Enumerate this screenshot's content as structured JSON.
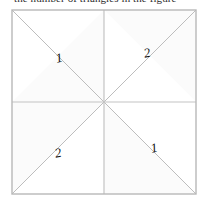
{
  "caption": {
    "text": "the number of triangles in the figure"
  },
  "figure": {
    "name": "square-divided-into-eight-triangles",
    "square": {
      "x": 12,
      "y": 10,
      "size": 184
    },
    "colors": {
      "outline": "#b8b8b8",
      "inner_line": "#c0c0c0",
      "diagonal": "#bdbdbd",
      "fill_light": "#ffffff",
      "fill_shade": "#fafafa",
      "label": "#111111"
    },
    "labels": [
      {
        "id": "label-top-left",
        "text": "1",
        "x": 60,
        "y": 62,
        "rotate": -12
      },
      {
        "id": "label-top-right",
        "text": "2",
        "x": 148,
        "y": 57,
        "rotate": -12
      },
      {
        "id": "label-bottom-left",
        "text": "2",
        "x": 59,
        "y": 157,
        "rotate": -12
      },
      {
        "id": "label-bottom-right",
        "text": "1",
        "x": 155,
        "y": 152,
        "rotate": -12
      }
    ],
    "quadrants": [
      {
        "name": "top-left",
        "diagonal": "main",
        "label": "1"
      },
      {
        "name": "top-right",
        "diagonal": "anti",
        "label": "2"
      },
      {
        "name": "bottom-left",
        "diagonal": "anti",
        "label": "2"
      },
      {
        "name": "bottom-right",
        "diagonal": "main",
        "label": "1"
      }
    ]
  }
}
